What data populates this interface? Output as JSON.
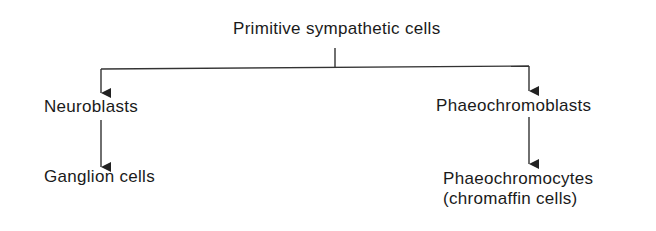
{
  "diagram": {
    "type": "tree",
    "colors": {
      "text": "#1a1a1a",
      "line": "#333333",
      "background": "#ffffff"
    },
    "root": {
      "label": "Primitive sympathetic cells"
    },
    "branches": [
      {
        "label": "Neuroblasts",
        "children": [
          {
            "label": "Ganglion cells"
          }
        ]
      },
      {
        "label": "Phaeochromoblasts",
        "children": [
          {
            "label": "Phaeochromocytes",
            "sublabel": "(chromaffin cells)"
          }
        ]
      }
    ],
    "edges": [
      {
        "from": "Primitive sympathetic cells",
        "to": "Neuroblasts"
      },
      {
        "from": "Primitive sympathetic cells",
        "to": "Phaeochromoblasts"
      },
      {
        "from": "Neuroblasts",
        "to": "Ganglion cells"
      },
      {
        "from": "Phaeochromoblasts",
        "to": "Phaeochromocytes (chromaffin cells)"
      }
    ]
  }
}
